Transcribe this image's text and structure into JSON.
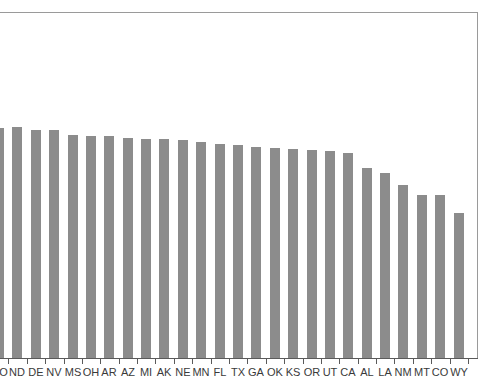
{
  "chart_data": {
    "type": "bar",
    "title": "",
    "subtitle": "",
    "xlabel": "",
    "ylabel": "",
    "grid": false,
    "legend": null,
    "orientation": "vertical",
    "bar_color": "#8c8c8c",
    "axis_color": "#5a5a5a",
    "frame_color": "#9a9a9a",
    "background_color": "#ffffff",
    "ylim": [
      0,
      100
    ],
    "note": "First category label is clipped at the left edge of the screenshot; bars are sorted in descending order.",
    "categories": [
      "MO",
      "ND",
      "DE",
      "NV",
      "MS",
      "OH",
      "AR",
      "AZ",
      "MI",
      "AK",
      "NE",
      "MN",
      "FL",
      "TX",
      "GA",
      "OK",
      "KS",
      "OR",
      "UT",
      "CA",
      "AL",
      "LA",
      "NM",
      "MT",
      "CO",
      "WY"
    ],
    "values": [
      66.5,
      66.8,
      66.0,
      66.0,
      64.5,
      64.2,
      64.2,
      63.5,
      63.2,
      63.2,
      63.0,
      62.3,
      62.0,
      61.5,
      61.0,
      60.8,
      60.3,
      60.0,
      59.8,
      59.4,
      55.0,
      53.5,
      50.0,
      47.0,
      47.0,
      41.8
    ]
  }
}
